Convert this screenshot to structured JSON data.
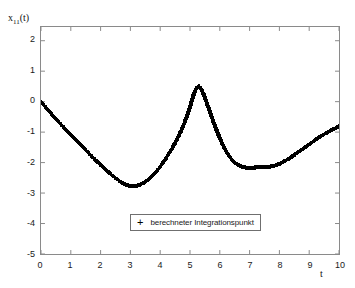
{
  "chart_data": {
    "type": "scatter",
    "title": "",
    "xlabel": "t",
    "ylabel": "x_11(t)",
    "ylabel_base": "x",
    "ylabel_sub": "11",
    "ylabel_suffix": "(t)",
    "xlim": [
      0,
      10
    ],
    "ylim": [
      -5,
      2.45
    ],
    "grid": false,
    "xticks": [
      0,
      1,
      2,
      3,
      4,
      5,
      6,
      7,
      8,
      9,
      10
    ],
    "xticklabels": [
      "0",
      "1",
      "2",
      "3",
      "4",
      "5",
      "6",
      "7",
      "8",
      "9",
      "10"
    ],
    "yticks": [
      2,
      1,
      0,
      -1,
      -2,
      -3,
      -4,
      -5
    ],
    "yticklabels": [
      "2",
      "1",
      "0",
      "-1",
      "-2",
      "-3",
      "-4",
      "-5"
    ],
    "legend": {
      "position": "lower-center",
      "entries": [
        {
          "marker": "+",
          "label": "berechneter Integrationspunkt"
        }
      ]
    },
    "marker": "+",
    "marker_color": "#000000",
    "series": [
      {
        "name": "berechneter Integrationspunkt",
        "x": [
          0.0,
          0.06,
          0.12,
          0.18,
          0.25,
          0.32,
          0.4,
          0.48,
          0.56,
          0.64,
          0.72,
          0.8,
          0.88,
          0.96,
          1.04,
          1.12,
          1.2,
          1.28,
          1.36,
          1.44,
          1.52,
          1.6,
          1.68,
          1.76,
          1.84,
          1.92,
          2.0,
          2.08,
          2.16,
          2.24,
          2.32,
          2.4,
          2.48,
          2.56,
          2.64,
          2.72,
          2.8,
          2.88,
          2.96,
          3.04,
          3.12,
          3.2,
          3.28,
          3.36,
          3.44,
          3.52,
          3.6,
          3.68,
          3.76,
          3.84,
          3.92,
          4.0,
          4.08,
          4.16,
          4.24,
          4.32,
          4.4,
          4.48,
          4.56,
          4.64,
          4.72,
          4.8,
          4.88,
          4.94,
          5.0,
          5.06,
          5.12,
          5.18,
          5.24,
          5.3,
          5.36,
          5.44,
          5.52,
          5.6,
          5.7,
          5.8,
          5.9,
          6.0,
          6.1,
          6.2,
          6.3,
          6.4,
          6.5,
          6.6,
          6.7,
          6.8,
          6.9,
          7.0,
          7.1,
          7.2,
          7.3,
          7.4,
          7.5,
          7.6,
          7.7,
          7.8,
          7.9,
          8.0,
          8.1,
          8.2,
          8.3,
          8.4,
          8.5,
          8.6,
          8.7,
          8.8,
          8.9,
          9.0,
          9.1,
          9.2,
          9.3,
          9.4,
          9.5,
          9.6,
          9.7,
          9.8,
          9.9,
          10.0
        ],
        "y": [
          0.0,
          -0.07,
          -0.14,
          -0.21,
          -0.29,
          -0.37,
          -0.46,
          -0.55,
          -0.63,
          -0.72,
          -0.8,
          -0.88,
          -0.97,
          -1.05,
          -1.13,
          -1.21,
          -1.29,
          -1.37,
          -1.45,
          -1.53,
          -1.61,
          -1.69,
          -1.77,
          -1.85,
          -1.93,
          -2.0,
          -2.08,
          -2.15,
          -2.22,
          -2.29,
          -2.36,
          -2.43,
          -2.49,
          -2.55,
          -2.61,
          -2.66,
          -2.7,
          -2.74,
          -2.76,
          -2.77,
          -2.77,
          -2.76,
          -2.74,
          -2.71,
          -2.67,
          -2.62,
          -2.56,
          -2.49,
          -2.41,
          -2.32,
          -2.23,
          -2.13,
          -2.02,
          -1.91,
          -1.79,
          -1.66,
          -1.53,
          -1.39,
          -1.24,
          -1.08,
          -0.91,
          -0.73,
          -0.52,
          -0.36,
          -0.18,
          0.02,
          0.22,
          0.38,
          0.48,
          0.5,
          0.44,
          0.28,
          0.08,
          -0.14,
          -0.42,
          -0.7,
          -0.96,
          -1.2,
          -1.42,
          -1.61,
          -1.77,
          -1.9,
          -2.0,
          -2.07,
          -2.12,
          -2.15,
          -2.17,
          -2.17,
          -2.17,
          -2.16,
          -2.15,
          -2.15,
          -2.15,
          -2.14,
          -2.13,
          -2.11,
          -2.08,
          -2.04,
          -1.99,
          -1.94,
          -1.88,
          -1.82,
          -1.75,
          -1.68,
          -1.61,
          -1.54,
          -1.47,
          -1.4,
          -1.33,
          -1.26,
          -1.19,
          -1.13,
          -1.07,
          -1.01,
          -0.96,
          -0.91,
          -0.86,
          -0.81
        ]
      }
    ]
  }
}
